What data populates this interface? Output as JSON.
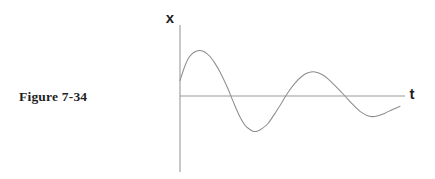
{
  "figure": {
    "caption": "Figure 7-34",
    "background_color": "#ffffff",
    "axis_color": "#9a9a9a",
    "curve_color": "#8d8d8d",
    "label_color": "#1f1f1f"
  },
  "axes": {
    "vertical": {
      "label": "x",
      "x": 180,
      "y_top": 25,
      "y_bottom": 172
    },
    "horizontal": {
      "label": "t",
      "y": 96,
      "x_left": 180,
      "x_right": 405
    },
    "origin": {
      "x": 180,
      "y": 96
    },
    "label_positions": {
      "x": {
        "x": 170,
        "y": 23
      },
      "t": {
        "x": 412,
        "y": 95
      }
    }
  },
  "chart_data": {
    "type": "line",
    "title": "Figure 7-34",
    "xlabel": "t",
    "ylabel": "x",
    "grid": false,
    "legend": null,
    "xlim": [
      0,
      225
    ],
    "ylim": [
      -71,
      71
    ],
    "series": [
      {
        "name": "damped oscillation",
        "color": "#8d8d8d",
        "points": [
          [
            0,
            18
          ],
          [
            4,
            32
          ],
          [
            8,
            43
          ],
          [
            12,
            49
          ],
          [
            16,
            52
          ],
          [
            20,
            53
          ],
          [
            25,
            51
          ],
          [
            30,
            46
          ],
          [
            35,
            38
          ],
          [
            40,
            28
          ],
          [
            47,
            11
          ],
          [
            53,
            -6
          ],
          [
            59,
            -22
          ],
          [
            65,
            -34
          ],
          [
            70,
            -39
          ],
          [
            73,
            -41
          ],
          [
            77,
            -41
          ],
          [
            82,
            -38
          ],
          [
            88,
            -32
          ],
          [
            94,
            -22
          ],
          [
            100,
            -11
          ],
          [
            108,
            4
          ],
          [
            115,
            15
          ],
          [
            122,
            23
          ],
          [
            128,
            27
          ],
          [
            135,
            28
          ],
          [
            142,
            25
          ],
          [
            148,
            20
          ],
          [
            155,
            12
          ],
          [
            165,
            0
          ],
          [
            172,
            -9
          ],
          [
            180,
            -18
          ],
          [
            186,
            -22
          ],
          [
            192,
            -24
          ],
          [
            198,
            -23
          ],
          [
            205,
            -20
          ],
          [
            212,
            -16
          ],
          [
            220,
            -12
          ]
        ],
        "key_features": {
          "start_value": 18,
          "peaks": [
            {
              "t": 20,
              "x": 53
            },
            {
              "t": 135,
              "x": 28
            }
          ],
          "troughs": [
            {
              "t": 75,
              "x": -41
            },
            {
              "t": 190,
              "x": -24
            }
          ],
          "zero_crossings": [
            47,
            108,
            165
          ]
        }
      }
    ]
  }
}
